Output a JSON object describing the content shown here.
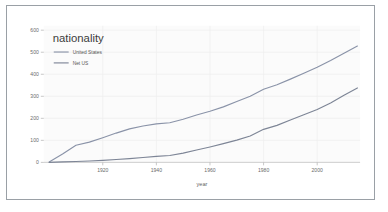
{
  "chart_data": {
    "type": "line",
    "title": "",
    "xlabel": "year",
    "ylabel": "",
    "xlim": [
      1898,
      2016
    ],
    "ylim": [
      0,
      620
    ],
    "grid": true,
    "legend": {
      "title": "nationality",
      "position": "top-left",
      "entries": [
        "United States",
        "Net US"
      ]
    },
    "xticks": [
      1920,
      1940,
      1960,
      1980,
      2000
    ],
    "yticks": [
      0,
      100,
      200,
      300,
      400,
      500,
      600
    ],
    "colors": {
      "united_states": "#8a93a8",
      "net_us": "#7d8596",
      "grid": "#eeeeee",
      "axis": "#c8c8c8",
      "plot_background": "#fbfbfb",
      "frame_border": "#9aa0a6"
    },
    "x": [
      1900,
      1905,
      1910,
      1915,
      1920,
      1925,
      1930,
      1935,
      1940,
      1945,
      1950,
      1955,
      1960,
      1965,
      1970,
      1975,
      1980,
      1985,
      1990,
      1995,
      2000,
      2005,
      2010,
      2015
    ],
    "series": [
      {
        "name": "United States",
        "values": [
          2,
          38,
          78,
          92,
          112,
          133,
          152,
          165,
          175,
          180,
          196,
          215,
          232,
          252,
          276,
          300,
          332,
          352,
          378,
          405,
          432,
          462,
          495,
          528
        ]
      },
      {
        "name": "Net US",
        "values": [
          0,
          2,
          4,
          6,
          9,
          13,
          17,
          22,
          27,
          31,
          42,
          56,
          70,
          85,
          101,
          120,
          150,
          168,
          192,
          216,
          240,
          270,
          305,
          338
        ]
      }
    ]
  }
}
